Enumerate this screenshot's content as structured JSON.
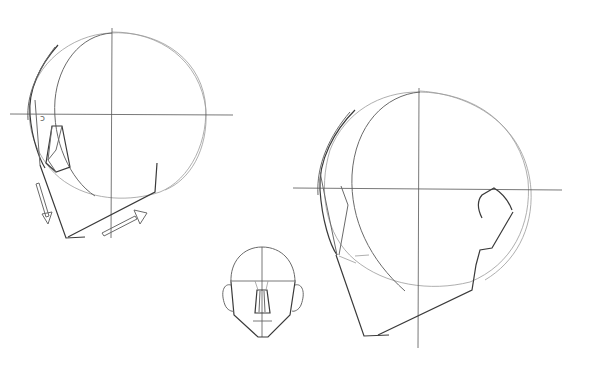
{
  "image": {
    "description": "Pencil sketch of head construction drawings",
    "background": "#ffffff",
    "stroke_color": "#3a3a3a",
    "figures": [
      {
        "name": "head-three-quarter-up-left",
        "annotation_glyph": "ↄ"
      },
      {
        "name": "head-front-small"
      },
      {
        "name": "head-three-quarter-up-right"
      }
    ]
  }
}
